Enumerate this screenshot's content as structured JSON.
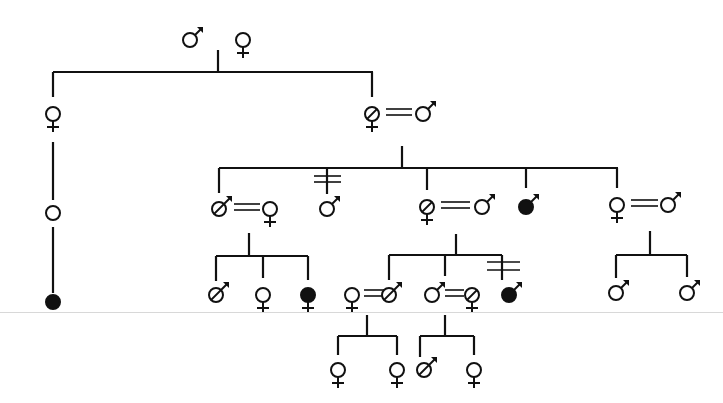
{
  "diagram": {
    "type": "pedigree",
    "line_color": "#111111",
    "fill_affected": "#111111",
    "background": "#ffffff",
    "legend_symbols": {
      "male": "♂",
      "female": "♀",
      "carrier_slash": "⌀ slashed circle",
      "affected": "filled circle",
      "unknown_sex": "open circle",
      "marriage": "double line ═",
      "break_marker": "double tick ╪"
    },
    "individuals": [
      {
        "id": "I-1",
        "sex": "male",
        "status": "normal",
        "x": 190,
        "y": 40
      },
      {
        "id": "I-2",
        "sex": "female",
        "status": "normal",
        "x": 243,
        "y": 40
      },
      {
        "id": "II-1",
        "sex": "female",
        "status": "normal",
        "x": 53,
        "y": 114
      },
      {
        "id": "II-2",
        "sex": "female",
        "status": "carrier",
        "x": 372,
        "y": 114
      },
      {
        "id": "II-3",
        "sex": "male",
        "status": "normal",
        "x": 423,
        "y": 114
      },
      {
        "id": "III-1",
        "sex": "unknown",
        "status": "normal",
        "x": 53,
        "y": 213
      },
      {
        "id": "III-2",
        "sex": "male",
        "status": "carrier",
        "x": 219,
        "y": 209
      },
      {
        "id": "III-3",
        "sex": "female",
        "status": "normal",
        "x": 270,
        "y": 209
      },
      {
        "id": "III-4",
        "sex": "male",
        "status": "normal",
        "x": 327,
        "y": 209
      },
      {
        "id": "III-5",
        "sex": "female",
        "status": "carrier",
        "x": 427,
        "y": 207
      },
      {
        "id": "III-6",
        "sex": "male",
        "status": "normal",
        "x": 482,
        "y": 207
      },
      {
        "id": "III-7",
        "sex": "male",
        "status": "affected",
        "x": 526,
        "y": 207
      },
      {
        "id": "III-8",
        "sex": "female",
        "status": "normal",
        "x": 617,
        "y": 205
      },
      {
        "id": "III-9",
        "sex": "male",
        "status": "normal",
        "x": 668,
        "y": 205
      },
      {
        "id": "IV-0",
        "sex": "unknown",
        "status": "affected",
        "x": 53,
        "y": 302
      },
      {
        "id": "IV-1",
        "sex": "male",
        "status": "carrier",
        "x": 216,
        "y": 295
      },
      {
        "id": "IV-2",
        "sex": "female",
        "status": "normal",
        "x": 263,
        "y": 295
      },
      {
        "id": "IV-3",
        "sex": "female",
        "status": "affected",
        "x": 308,
        "y": 295
      },
      {
        "id": "IV-4",
        "sex": "female",
        "status": "normal",
        "x": 352,
        "y": 295
      },
      {
        "id": "IV-5",
        "sex": "male",
        "status": "carrier",
        "x": 389,
        "y": 295
      },
      {
        "id": "IV-6",
        "sex": "male",
        "status": "normal",
        "x": 432,
        "y": 295
      },
      {
        "id": "IV-7",
        "sex": "female",
        "status": "carrier",
        "x": 472,
        "y": 295
      },
      {
        "id": "IV-8",
        "sex": "male",
        "status": "affected",
        "x": 509,
        "y": 295
      },
      {
        "id": "IV-9",
        "sex": "male",
        "status": "normal",
        "x": 616,
        "y": 293
      },
      {
        "id": "IV-10",
        "sex": "male",
        "status": "normal",
        "x": 687,
        "y": 293
      },
      {
        "id": "V-1",
        "sex": "female",
        "status": "normal",
        "x": 338,
        "y": 370
      },
      {
        "id": "V-2",
        "sex": "female",
        "status": "normal",
        "x": 397,
        "y": 370
      },
      {
        "id": "V-3",
        "sex": "male",
        "status": "carrier",
        "x": 424,
        "y": 370
      },
      {
        "id": "V-4",
        "sex": "female",
        "status": "normal",
        "x": 474,
        "y": 370
      }
    ]
  }
}
